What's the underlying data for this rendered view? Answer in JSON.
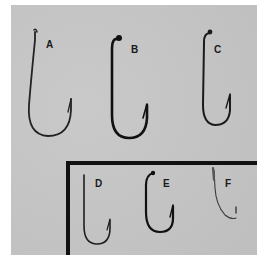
{
  "figure": {
    "background_color": "#c6c6c6",
    "hook_color": "#1e1e1e",
    "frame_color": "#111111",
    "hooks": [
      {
        "label": "A"
      },
      {
        "label": "B"
      },
      {
        "label": "C"
      },
      {
        "label": "D"
      },
      {
        "label": "E"
      },
      {
        "label": "F"
      }
    ]
  }
}
